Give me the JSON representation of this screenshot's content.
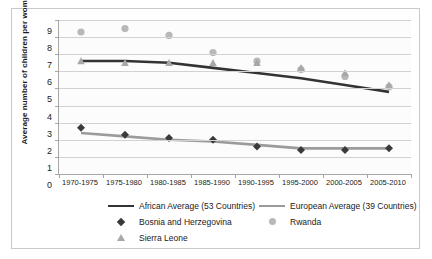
{
  "chart_data": {
    "type": "line",
    "title": "",
    "xlabel": "",
    "ylabel": "Average number of children per woman",
    "ylim": [
      0,
      9
    ],
    "ytick_step": 1,
    "grid": true,
    "legend_position": "bottom",
    "categories": [
      "1970-1975",
      "1975-1980",
      "1980-1985",
      "1985-1990",
      "1990-1995",
      "1995-2000",
      "2000-2005",
      "2005-2010"
    ],
    "yticks": [
      "0",
      "1",
      "2",
      "3",
      "4",
      "5",
      "6",
      "7",
      "8",
      "9"
    ],
    "series": [
      {
        "name": "African Average (53 Countries)",
        "style": "line",
        "color": "#333333",
        "values": [
          6.6,
          6.6,
          6.5,
          6.2,
          5.9,
          5.6,
          5.2,
          4.8
        ]
      },
      {
        "name": "European Average (39 Countries)",
        "style": "line",
        "color": "#9b9b9b",
        "values": [
          2.4,
          2.2,
          2.0,
          1.9,
          1.7,
          1.5,
          1.5,
          1.5
        ]
      },
      {
        "name": "Bosnia and Herzegovina",
        "style": "marker",
        "marker": "diamond",
        "color": "#3a3a3a",
        "values": [
          2.7,
          2.3,
          2.1,
          2.0,
          1.6,
          1.4,
          1.4,
          1.5
        ]
      },
      {
        "name": "Rwanda",
        "style": "marker",
        "marker": "circle",
        "color": "#b8b8b8",
        "values": [
          8.3,
          8.5,
          8.1,
          7.1,
          6.6,
          6.1,
          5.7,
          5.1
        ]
      },
      {
        "name": "Sierra Leone",
        "style": "marker",
        "marker": "triangle",
        "color": "#a8a8a8",
        "values": [
          6.6,
          6.5,
          6.5,
          6.5,
          6.5,
          6.2,
          5.9,
          5.2
        ]
      }
    ]
  },
  "legend": {
    "items": [
      {
        "label": "African Average (53 Countries)",
        "key": "line-dark"
      },
      {
        "label": "European Average (39 Countries)",
        "key": "line-gray"
      },
      {
        "label": "Bosnia and Herzegovina",
        "key": "diamond"
      },
      {
        "label": "Rwanda",
        "key": "circle"
      },
      {
        "label": "Sierra Leone",
        "key": "triangle"
      }
    ]
  }
}
